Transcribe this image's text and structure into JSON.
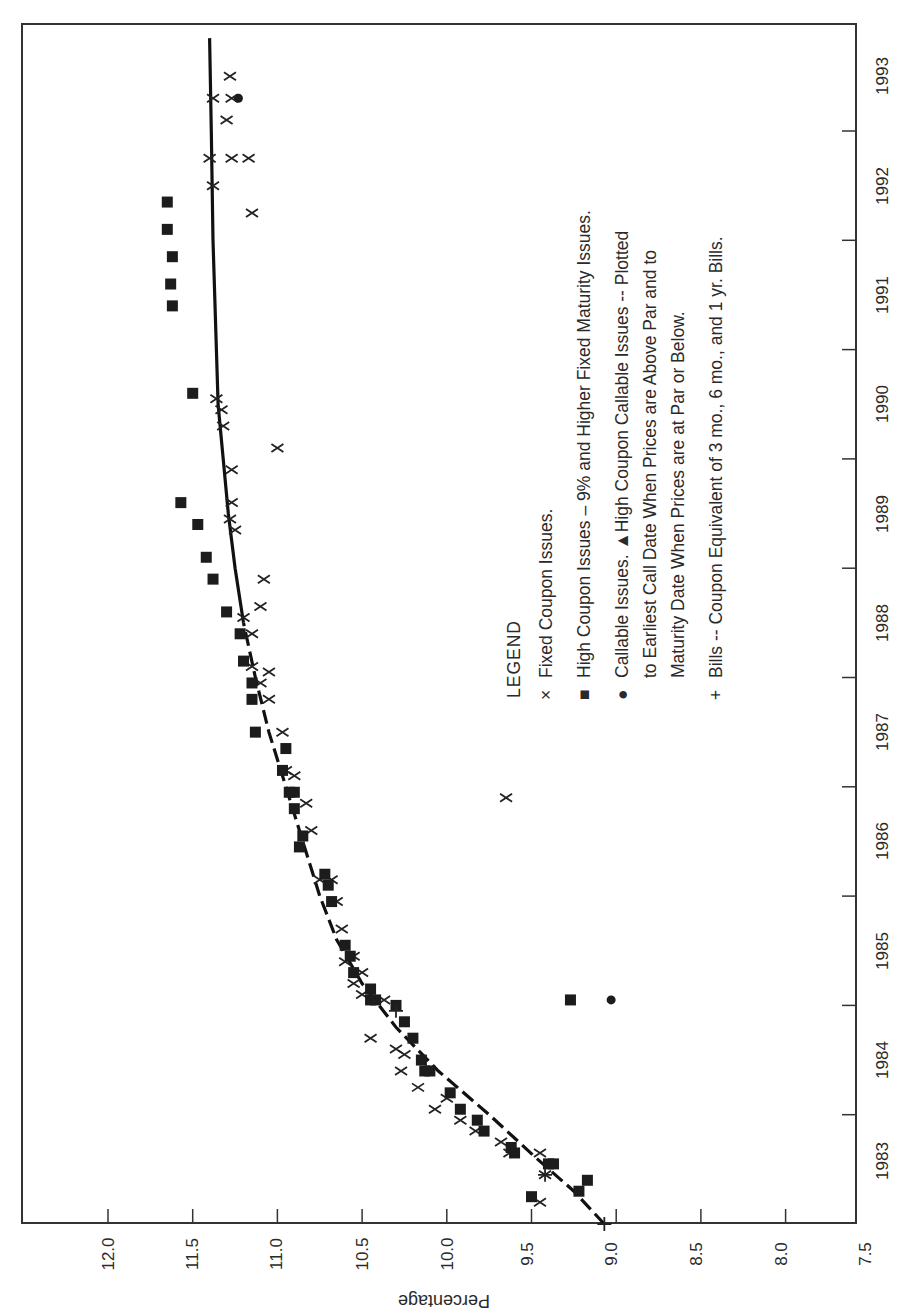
{
  "chart_data": {
    "type": "scatter",
    "title": "",
    "orientation": "rotated 90° clockwise (year axis on the right edge, percentage axis along the bottom)",
    "xlabel": "",
    "ylabel": "Percentage",
    "xlim": [
      1983,
      1993.8
    ],
    "ylim": [
      7.5,
      12.5
    ],
    "x_ticks": [
      "1983",
      "1984",
      "1985",
      "1986",
      "1987",
      "1988",
      "1989",
      "1990",
      "1991",
      "1992",
      "1993"
    ],
    "y_ticks": [
      "12.0",
      "11.5",
      "11.0",
      "10.5",
      "10.0",
      "9.5",
      "9.0",
      "8.5",
      "8.0",
      "7.5"
    ],
    "grid": false,
    "legend": {
      "title": "LEGEND",
      "entries": [
        {
          "marker": "×",
          "label": "Fixed Coupon Issues."
        },
        {
          "marker": "■",
          "label": "High Coupon Issues – 9% and Higher Fixed Maturity Issues."
        },
        {
          "marker": "●",
          "label": "Callable Issues.  ▲High Coupon Callable Issues -- Plotted",
          "line2": "to Earliest Call Date When Prices are Above Par and to",
          "line3": "Maturity Date When Prices are at Par or Below."
        },
        {
          "marker": "+",
          "label": "Bills -- Coupon Equivalent of 3 mo., 6 mo., and 1 yr. Bills."
        }
      ]
    },
    "series": [
      {
        "name": "Fixed Coupon Issues",
        "marker": "x",
        "points": [
          [
            1983.2,
            9.45
          ],
          [
            1983.45,
            9.42
          ],
          [
            1983.65,
            9.63
          ],
          [
            1983.65,
            9.45
          ],
          [
            1983.75,
            9.68
          ],
          [
            1983.85,
            9.83
          ],
          [
            1983.95,
            9.92
          ],
          [
            1984.05,
            10.07
          ],
          [
            1984.15,
            10.0
          ],
          [
            1984.25,
            10.17
          ],
          [
            1984.4,
            10.27
          ],
          [
            1984.55,
            10.25
          ],
          [
            1984.6,
            10.3
          ],
          [
            1984.7,
            10.45
          ],
          [
            1985.05,
            10.37
          ],
          [
            1985.1,
            10.5
          ],
          [
            1985.2,
            10.55
          ],
          [
            1985.3,
            10.5
          ],
          [
            1985.45,
            10.55
          ],
          [
            1985.4,
            10.6
          ],
          [
            1985.7,
            10.62
          ],
          [
            1985.95,
            10.65
          ],
          [
            1986.15,
            10.75
          ],
          [
            1986.15,
            10.68
          ],
          [
            1986.6,
            10.8
          ],
          [
            1986.85,
            10.83
          ],
          [
            1986.9,
            9.65
          ],
          [
            1987.1,
            10.9
          ],
          [
            1987.15,
            10.95
          ],
          [
            1987.5,
            10.97
          ],
          [
            1987.8,
            11.05
          ],
          [
            1987.95,
            11.1
          ],
          [
            1988.05,
            11.05
          ],
          [
            1988.1,
            11.15
          ],
          [
            1988.4,
            11.15
          ],
          [
            1988.55,
            11.2
          ],
          [
            1988.65,
            11.1
          ],
          [
            1988.9,
            11.08
          ],
          [
            1989.35,
            11.25
          ],
          [
            1989.45,
            11.28
          ],
          [
            1989.6,
            11.27
          ],
          [
            1989.9,
            11.27
          ],
          [
            1990.1,
            11.0
          ],
          [
            1990.3,
            11.32
          ],
          [
            1990.45,
            11.33
          ],
          [
            1990.55,
            11.36
          ],
          [
            1992.25,
            11.15
          ],
          [
            1992.5,
            11.38
          ],
          [
            1992.75,
            11.4
          ],
          [
            1992.75,
            11.27
          ],
          [
            1992.75,
            11.17
          ],
          [
            1993.1,
            11.3
          ],
          [
            1993.3,
            11.38
          ],
          [
            1993.3,
            11.27
          ],
          [
            1993.5,
            11.28
          ]
        ]
      },
      {
        "name": "High Coupon Issues – 9% and Higher Fixed Maturity Issues",
        "marker": "square",
        "points": [
          [
            1983.25,
            9.5
          ],
          [
            1983.3,
            9.22
          ],
          [
            1983.4,
            9.17
          ],
          [
            1983.55,
            9.4
          ],
          [
            1983.55,
            9.37
          ],
          [
            1983.65,
            9.6
          ],
          [
            1983.7,
            9.62
          ],
          [
            1983.85,
            9.78
          ],
          [
            1983.95,
            9.82
          ],
          [
            1984.05,
            9.92
          ],
          [
            1984.2,
            9.98
          ],
          [
            1984.4,
            10.13
          ],
          [
            1984.4,
            10.1
          ],
          [
            1984.5,
            10.15
          ],
          [
            1984.7,
            10.2
          ],
          [
            1984.85,
            10.25
          ],
          [
            1985.0,
            10.3
          ],
          [
            1985.05,
            10.45
          ],
          [
            1985.05,
            10.42
          ],
          [
            1985.05,
            9.27
          ],
          [
            1985.15,
            10.45
          ],
          [
            1985.3,
            10.55
          ],
          [
            1985.45,
            10.57
          ],
          [
            1985.55,
            10.6
          ],
          [
            1985.95,
            10.68
          ],
          [
            1986.1,
            10.7
          ],
          [
            1986.2,
            10.72
          ],
          [
            1986.45,
            10.87
          ],
          [
            1986.55,
            10.85
          ],
          [
            1986.8,
            10.9
          ],
          [
            1986.95,
            10.9
          ],
          [
            1986.95,
            10.93
          ],
          [
            1987.15,
            10.97
          ],
          [
            1987.35,
            10.95
          ],
          [
            1987.5,
            11.13
          ],
          [
            1987.8,
            11.15
          ],
          [
            1987.95,
            11.15
          ],
          [
            1988.15,
            11.2
          ],
          [
            1988.4,
            11.22
          ],
          [
            1988.6,
            11.3
          ],
          [
            1988.9,
            11.38
          ],
          [
            1989.1,
            11.42
          ],
          [
            1989.4,
            11.47
          ],
          [
            1989.6,
            11.57
          ],
          [
            1990.6,
            11.5
          ],
          [
            1991.4,
            11.62
          ],
          [
            1991.6,
            11.63
          ],
          [
            1991.85,
            11.62
          ],
          [
            1992.1,
            11.65
          ],
          [
            1992.35,
            11.65
          ]
        ]
      },
      {
        "name": "Callable Issues",
        "marker": "circle",
        "points": [
          [
            1985.05,
            9.03
          ],
          [
            1993.3,
            11.23
          ]
        ]
      },
      {
        "name": "Bills -- Coupon Equivalent",
        "marker": "plus",
        "points": [
          [
            1983.0,
            9.07
          ],
          [
            1983.45,
            9.42
          ],
          [
            1984.95,
            10.3
          ]
        ]
      },
      {
        "name": "Yield Curve (fitted)",
        "marker": "line",
        "points": [
          [
            1983.0,
            9.07
          ],
          [
            1983.3,
            9.25
          ],
          [
            1983.6,
            9.47
          ],
          [
            1984.0,
            9.75
          ],
          [
            1984.4,
            10.05
          ],
          [
            1984.8,
            10.3
          ],
          [
            1985.2,
            10.5
          ],
          [
            1985.6,
            10.65
          ],
          [
            1986.0,
            10.75
          ],
          [
            1986.5,
            10.85
          ],
          [
            1987.0,
            10.95
          ],
          [
            1987.5,
            11.05
          ],
          [
            1988.0,
            11.13
          ],
          [
            1988.5,
            11.2
          ],
          [
            1989.0,
            11.25
          ],
          [
            1989.5,
            11.29
          ],
          [
            1990.0,
            11.32
          ],
          [
            1990.5,
            11.35
          ],
          [
            1991.0,
            11.36
          ],
          [
            1992.0,
            11.38
          ],
          [
            1993.0,
            11.39
          ],
          [
            1993.85,
            11.4
          ]
        ]
      }
    ]
  },
  "axes": {
    "percentage_label": "Percentage",
    "percentage_ticks": [
      "12.0",
      "11.5",
      "11.0",
      "10.5",
      "10.0",
      "9.5",
      "9.0",
      "8.5",
      "8.0",
      "7.5"
    ],
    "year_ticks": [
      "1983",
      "1984",
      "1985",
      "1986",
      "1987",
      "1988",
      "1989",
      "1990",
      "1991",
      "1992",
      "1993"
    ]
  },
  "legend": {
    "title": "LEGEND",
    "item1_marker": "×",
    "item1_text": "Fixed Coupon Issues.",
    "item2_marker": "■",
    "item2_text": "High Coupon Issues – 9% and Higher Fixed Maturity Issues.",
    "item3_marker": "●",
    "item3_text_line1": "Callable Issues.  ▲High Coupon Callable Issues -- Plotted",
    "item3_text_line2": "to Earliest Call Date When Prices are Above Par and to",
    "item3_text_line3": "Maturity Date When Prices are at Par or Below.",
    "item4_marker": "+",
    "item4_text": "Bills -- Coupon Equivalent of 3 mo., 6 mo., and 1 yr. Bills."
  }
}
